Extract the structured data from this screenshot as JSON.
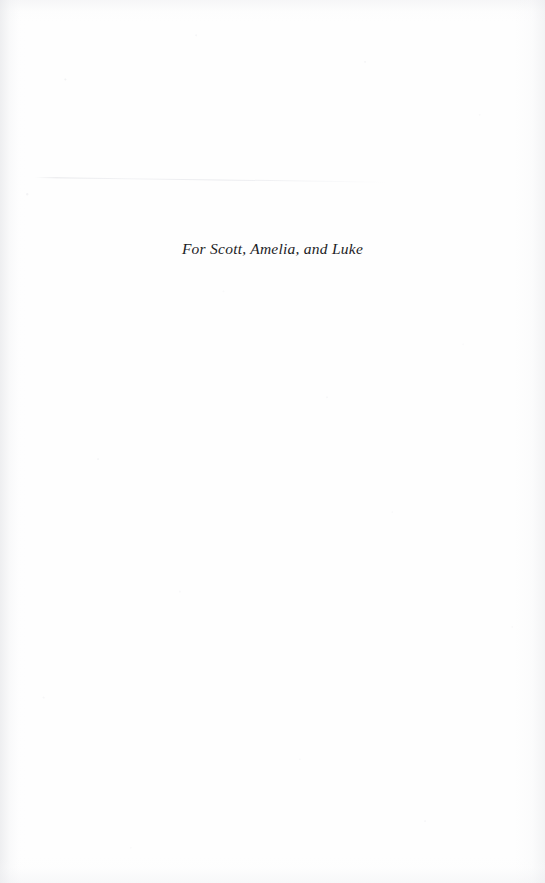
{
  "page": {
    "kind": "book-dedication-page",
    "width": 545,
    "height": 883,
    "background_color": "#fefefe",
    "text_color": "#1c1c1e"
  },
  "dedication": {
    "text": "For Scott, Amelia, and Luke"
  },
  "artifacts": {
    "scan_streak": "faint-horizontal-scan-line",
    "edge_shading": "faint-gutter-shading",
    "speckles": "faint-paper-noise"
  }
}
